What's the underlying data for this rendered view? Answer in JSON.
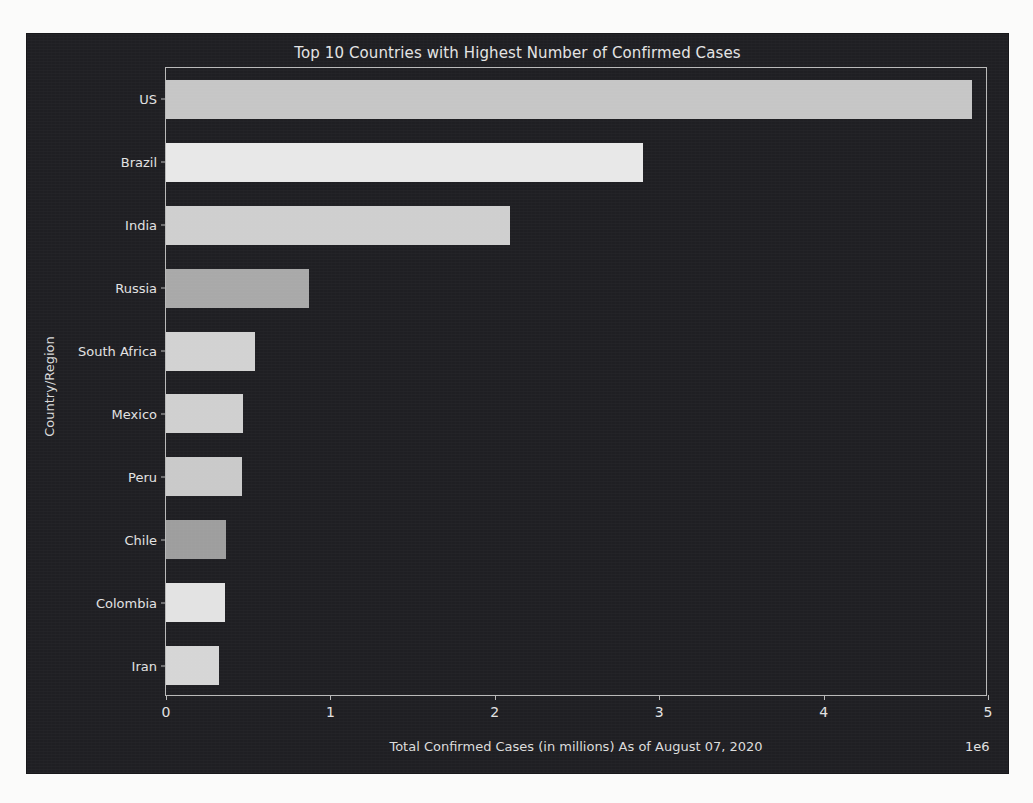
{
  "chart_data": {
    "type": "bar",
    "orientation": "horizontal",
    "title": "Top 10 Countries with Highest Number of Confirmed Cases",
    "xlabel": "Total Confirmed Cases (in millions) As of August 07, 2020",
    "ylabel": "Country/Region",
    "exponent_label": "1e6",
    "categories": [
      "US",
      "Brazil",
      "India",
      "Russia",
      "South Africa",
      "Mexico",
      "Peru",
      "Chile",
      "Colombia",
      "Iran"
    ],
    "values": [
      4900000,
      2900000,
      2090000,
      870000,
      540000,
      470000,
      463000,
      368000,
      357000,
      320000
    ],
    "xlim": [
      0,
      5000000
    ],
    "ylim_categories": 10,
    "xticks": [
      0,
      1000000,
      2000000,
      3000000,
      4000000,
      5000000
    ],
    "xtick_labels": [
      "0",
      "1",
      "2",
      "3",
      "4",
      "5"
    ],
    "grid": false,
    "legend": "none",
    "bar_colors": [
      "#c6c6c6",
      "#e8e8e8",
      "#cfcfcf",
      "#a9a9a9",
      "#d2d2d2",
      "#d0d0d0",
      "#cacaca",
      "#9e9e9e",
      "#e3e3e3",
      "#d6d6d6"
    ],
    "style": "dark_background",
    "figure_background": "#1f1f23",
    "axes_text_color": "#e2e2e2"
  },
  "figure": {
    "title": "Top 10 Countries with Highest Number of Confirmed Cases",
    "ylabel": "Country/Region",
    "xlabel": "Total Confirmed Cases (in millions) As of August 07, 2020",
    "exponent": "1e6"
  }
}
